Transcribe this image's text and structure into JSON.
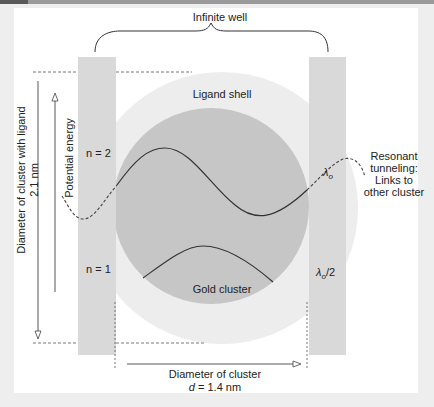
{
  "diagram": {
    "title_well": "Infinite well",
    "ligand_shell": "Ligand shell",
    "gold_cluster": "Gold cluster",
    "level_n2": "n = 2",
    "level_n1": "n = 1",
    "lambda_o": "λo",
    "lambda_sym": "λ",
    "lambda_sub": "o",
    "lambda_half_suffix": "/2",
    "tunneling_line1": "Resonant",
    "tunneling_line2": "tunneling:",
    "tunneling_line3": "Links to",
    "tunneling_line4": "other cluster",
    "diam_ligand_line1": "Diameter of cluster with ligand",
    "diam_ligand_line2": "2.1 nm",
    "potential_energy": "Potential energy",
    "diam_cluster_line1": "Diameter of cluster",
    "diam_cluster_var": "d",
    "diam_cluster_value": " = 1.4 nm"
  },
  "colors": {
    "background": "#eeeeee",
    "panel": "#ffffff",
    "wall": "#d9d9d9",
    "ligand_shell": "#ececec",
    "gold_cluster": "#c4c4c4",
    "line": "#333333"
  }
}
